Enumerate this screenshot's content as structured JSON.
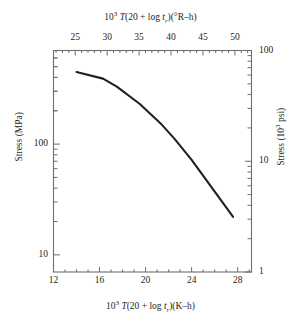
{
  "chart_data": {
    "type": "line",
    "title": "",
    "top_xlabel_html": "10<sup>3</sup> <i>T</i>(20 + log <i>t</i><sub>r</sub>)(°R–h)",
    "bottom_xlabel_html": "10<sup>3</sup> <i>T</i>(20 + log <i>t</i><sub>r</sub>)(K–h)",
    "left_ylabel": "Stress (MPa)",
    "right_ylabel_html": "Stress (10<sup>3</sup> psi)",
    "top_xlabel_plain": "10^3 T(20 + log t_r)(°R–h)",
    "bottom_xlabel_plain": "10^3 T(20 + log t_r)(K–h)",
    "right_ylabel_plain": "Stress (10^3 psi)",
    "top_xticks": [
      25,
      30,
      35,
      40,
      45,
      50
    ],
    "bottom_xticks": [
      12,
      16,
      20,
      24,
      28
    ],
    "bottom_xlim": [
      12,
      29.2
    ],
    "top_xlim": [
      21.6,
      52.6
    ],
    "left_yticks": [
      10,
      100
    ],
    "left_ylim": [
      7,
      700
    ],
    "right_yticks": [
      1,
      10,
      100
    ],
    "right_ylim": [
      1,
      100
    ],
    "yscale": "log",
    "xscale": "linear",
    "grid": false,
    "legend": "none",
    "series": [
      {
        "name": "Creep rupture stress",
        "x_label_axis": "bottom (K-h)",
        "y_label_axis": "left (MPa)",
        "x": [
          14.0,
          16.3,
          17.5,
          19.5,
          21.4,
          22.5,
          24.0,
          25.5,
          27.6
        ],
        "y": [
          448,
          390,
          330,
          230,
          150,
          112,
          72,
          44,
          22
        ]
      }
    ],
    "annotations": []
  }
}
